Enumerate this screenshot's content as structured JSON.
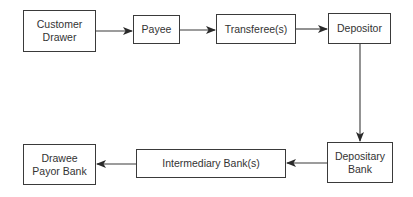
{
  "diagram": {
    "type": "flowchart",
    "nodes": [
      {
        "id": "customer_drawer",
        "label": "Customer\nDrawer"
      },
      {
        "id": "payee",
        "label": "Payee"
      },
      {
        "id": "transferees",
        "label": "Transferee(s)"
      },
      {
        "id": "depositor",
        "label": "Depositor"
      },
      {
        "id": "depositary_bank",
        "label": "Depositary\nBank"
      },
      {
        "id": "intermediary_banks",
        "label": "Intermediary Bank(s)"
      },
      {
        "id": "drawee_payor_bank",
        "label": "Drawee\nPayor Bank"
      }
    ],
    "edges": [
      {
        "from": "customer_drawer",
        "to": "payee"
      },
      {
        "from": "payee",
        "to": "transferees"
      },
      {
        "from": "transferees",
        "to": "depositor"
      },
      {
        "from": "depositor",
        "to": "depositary_bank"
      },
      {
        "from": "depositary_bank",
        "to": "intermediary_banks"
      },
      {
        "from": "intermediary_banks",
        "to": "drawee_payor_bank"
      }
    ],
    "colors": {
      "stroke": "#3a3a3a",
      "text": "#333333",
      "background": "#ffffff"
    }
  }
}
